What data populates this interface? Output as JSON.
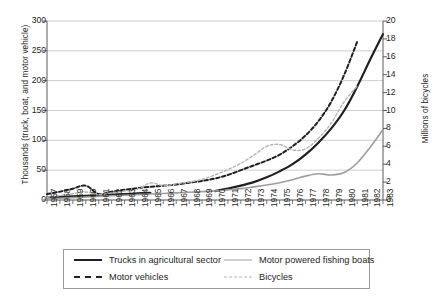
{
  "chart_data": {
    "type": "line",
    "title": "",
    "xlabel": "",
    "ylabel": "Thousands (truck, boat, and motor vehicle)",
    "y2label": "Millions of bicycles",
    "grid": true,
    "legend_position": "bottom",
    "ylim": [
      0,
      300
    ],
    "y2lim": [
      0,
      20
    ],
    "yticks": [
      0,
      50,
      100,
      150,
      200,
      250,
      300
    ],
    "y2ticks": [
      0,
      2,
      4,
      6,
      8,
      10,
      12,
      14,
      16,
      18,
      20
    ],
    "x": [
      1957,
      1958,
      1959,
      1960,
      1961,
      1962,
      1963,
      1964,
      1965,
      1966,
      1967,
      1968,
      1969,
      1970,
      1971,
      1972,
      1973,
      1974,
      1975,
      1976,
      1977,
      1978,
      1979,
      1980,
      1981,
      1982,
      1983
    ],
    "xticklabels": [
      "1957",
      "1958",
      "1959",
      "1960",
      "1961",
      "1962",
      "1963",
      "1964",
      "1965",
      "1966",
      "1967",
      "1968",
      "1969",
      "1970",
      "1971",
      "1972",
      "1973",
      "1974",
      "1975",
      "1976",
      "1977",
      "1978",
      "1979",
      "1980",
      "1981",
      "1982",
      "1983"
    ],
    "series": [
      {
        "name": "Trucks in agricultural sector",
        "axis": "left",
        "color": "#231f20",
        "style": "solid",
        "width": 2.2,
        "x": [
          1957,
          1958,
          1959,
          1960,
          1961,
          1962,
          1963,
          1964,
          1965
        ],
        "values": [
          4,
          5,
          6,
          7,
          8,
          9,
          10,
          11,
          12
        ]
      },
      {
        "name": "Trucks in agricultural sector",
        "axis": "left",
        "color": "#231f20",
        "style": "solid",
        "width": 2.2,
        "segment": 2,
        "x": [
          1970,
          1971,
          1972,
          1973,
          1974,
          1975,
          1976,
          1977,
          1978,
          1979,
          1980,
          1981,
          1982,
          1983
        ],
        "values": [
          15,
          19,
          24,
          30,
          38,
          48,
          60,
          76,
          96,
          120,
          150,
          190,
          235,
          278
        ]
      },
      {
        "name": "Motor vehicles",
        "axis": "left",
        "color": "#231f20",
        "style": "dashed",
        "width": 2.0,
        "x": [
          1957,
          1958,
          1959,
          1960,
          1961,
          1962,
          1963,
          1964,
          1965,
          1966,
          1967,
          1968,
          1969,
          1970,
          1971,
          1972,
          1973,
          1974,
          1975,
          1976,
          1977,
          1978,
          1979,
          1980,
          1981
        ],
        "values": [
          10,
          14,
          19,
          24,
          10,
          14,
          17,
          20,
          22,
          24,
          26,
          29,
          32,
          36,
          42,
          50,
          58,
          66,
          76,
          90,
          108,
          132,
          165,
          210,
          265
        ]
      },
      {
        "name": "Motor powered fishing boats",
        "axis": "left",
        "color": "#9d9d9d",
        "style": "solid",
        "width": 1.6,
        "x": [
          1957,
          1958,
          1959,
          1960,
          1961,
          1962,
          1963,
          1964,
          1965,
          1966,
          1967,
          1968,
          1969,
          1970,
          1971,
          1972,
          1973,
          1974,
          1975,
          1976,
          1977,
          1978,
          1979,
          1980,
          1981,
          1982,
          1983
        ],
        "values": [
          2,
          3,
          4,
          5,
          6,
          7,
          8,
          9,
          10,
          11,
          12,
          13,
          14,
          15,
          17,
          19,
          22,
          25,
          29,
          34,
          40,
          44,
          42,
          46,
          62,
          88,
          118
        ]
      },
      {
        "name": "Bicycles",
        "axis": "right",
        "color": "#b4b4b4",
        "style": "dotted",
        "width": 1.4,
        "x": [
          1957,
          1958,
          1959,
          1960,
          1961,
          1962,
          1963,
          1964,
          1965,
          1966,
          1967,
          1968,
          1969,
          1970,
          1971,
          1972,
          1973,
          1974,
          1975,
          1976,
          1977,
          1978,
          1979,
          1980,
          1981
        ],
        "values": [
          0.3,
          0.5,
          0.7,
          0.9,
          0.6,
          0.8,
          1.0,
          1.2,
          1.9,
          1.6,
          1.8,
          2.0,
          2.3,
          2.8,
          3.4,
          4.1,
          5.0,
          6.0,
          6.2,
          5.6,
          5.7,
          6.9,
          8.6,
          11.0,
          12.7
        ]
      }
    ],
    "legend": [
      {
        "label": "Trucks in agricultural sector",
        "swatch": "solid-black"
      },
      {
        "label": "Motor powered fishing boats",
        "swatch": "solid-gray"
      },
      {
        "label": "Motor vehicles",
        "swatch": "dash-black"
      },
      {
        "label": "Bicycles",
        "swatch": "dot-gray"
      }
    ]
  }
}
